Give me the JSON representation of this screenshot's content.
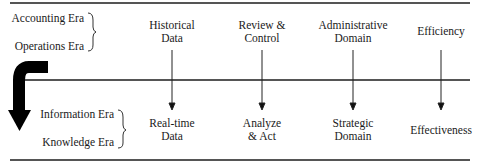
{
  "diagram": {
    "top_group": {
      "eras": [
        "Accounting Era",
        "Operations Era"
      ]
    },
    "bottom_group": {
      "eras": [
        "Information Era",
        "Knowledge Era"
      ]
    },
    "columns": [
      {
        "from_line1": "Historical",
        "from_line2": "Data",
        "to_line1": "Real-time",
        "to_line2": "Data"
      },
      {
        "from_line1": "Review &",
        "from_line2": "Control",
        "to_line1": "Analyze",
        "to_line2": "& Act"
      },
      {
        "from_line1": "Administrative",
        "from_line2": "Domain",
        "to_line1": "Strategic",
        "to_line2": "Domain"
      },
      {
        "from_line1": "Efficiency",
        "from_line2": "",
        "to_line1": "Effectiveness",
        "to_line2": ""
      }
    ],
    "colors": {
      "line": "#555555",
      "arrow": "#000000",
      "text": "#1a1a1a"
    }
  }
}
